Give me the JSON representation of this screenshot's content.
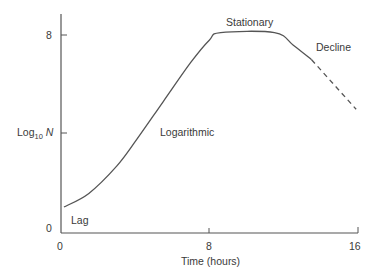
{
  "chart_data": {
    "type": "line",
    "title": "",
    "xlabel": "Time (hours)",
    "ylabel": "Log10 N",
    "ylabel_parts": {
      "base": "Log",
      "sub": "10",
      "var": "N"
    },
    "xlim": [
      0,
      16
    ],
    "ylim": [
      0,
      8.8
    ],
    "x_ticks": [
      0,
      8,
      16
    ],
    "x_tick_labels": [
      "0",
      "8",
      "16"
    ],
    "y_ticks": [
      0,
      8
    ],
    "y_tick_labels": [
      "0",
      "8"
    ],
    "grid": false,
    "legend": null,
    "series": [
      {
        "name": "Growth curve (solid)",
        "style": "solid",
        "x": [
          0.16,
          1.5,
          3.0,
          4.1,
          5.5,
          7.0,
          8.0,
          8.6,
          11.5,
          12.5,
          13.5
        ],
        "y": [
          1.05,
          1.6,
          2.7,
          3.8,
          5.3,
          6.9,
          7.8,
          8.1,
          8.1,
          7.6,
          7.0
        ]
      },
      {
        "name": "Decline (extrapolated, dashed)",
        "style": "dashed",
        "x": [
          13.5,
          15.9
        ],
        "y": [
          7.0,
          5.0
        ]
      }
    ],
    "annotations": [
      {
        "text": "Lag",
        "x": 0.8,
        "y": 0.4
      },
      {
        "text": "Logarithmic",
        "x": 6.9,
        "y": 3.8
      },
      {
        "text": "Stationary",
        "x": 10.0,
        "y": 8.7
      },
      {
        "text": "Decline",
        "x": 14.6,
        "y": 7.8
      }
    ],
    "extra_y_tick": {
      "label": "Log10 N",
      "y": 4.05
    }
  },
  "labels": {
    "y_log": "Log",
    "y_sub": "10",
    "y_var": "N",
    "x_title": "Time (hours)",
    "y_tick_0": "0",
    "y_tick_8": "8",
    "x_tick_0": "0",
    "x_tick_8": "8",
    "x_tick_16": "16",
    "phase_lag": "Lag",
    "phase_log": "Logarithmic",
    "phase_stationary": "Stationary",
    "phase_decline": "Decline"
  },
  "colors": {
    "axis": "#555555",
    "curve": "#555555",
    "text": "#3a3a3a"
  }
}
